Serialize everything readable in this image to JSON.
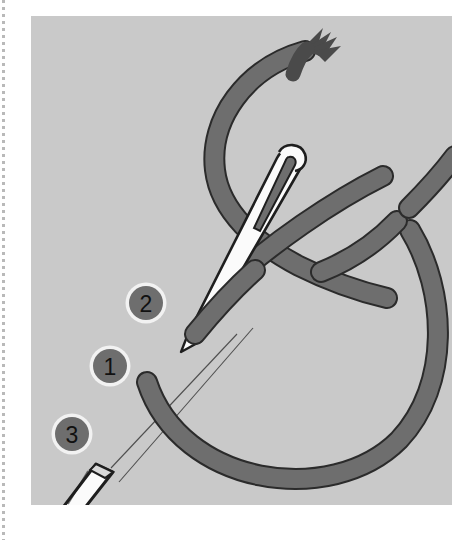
{
  "figure": {
    "background_color": "#c9c9c9",
    "page_color": "#ffffff",
    "thread_color": "#6e6e6e",
    "thread_outline_color": "#2b2b2b",
    "needle_color": "#fbfbfb",
    "needle_outline_color": "#1e1e1e",
    "marker_fill_color": "#6e6e6e",
    "marker_ring_color": "#f2f2f2",
    "marker_text_color": "#111111",
    "guide_line_color": "#3a3a3a"
  },
  "markers": [
    {
      "label": "2",
      "name": "step-marker-2",
      "cx": 115,
      "cy": 287,
      "r": 18
    },
    {
      "label": "1",
      "name": "step-marker-1",
      "cx": 79,
      "cy": 350,
      "r": 18
    },
    {
      "label": "3",
      "name": "step-marker-3",
      "cx": 41,
      "cy": 418,
      "r": 18
    }
  ],
  "elements": {
    "needle": "sewing-needle",
    "needle_eye": "needle-eye",
    "thread_loop": "thread-loop",
    "thread_tail_frayed": "frayed-thread-end",
    "thread_segments_right": "segmented-thread-right",
    "fabric_guide_lines": "fabric-guide-lines",
    "white_tube": "white-thread-end"
  },
  "margin": {
    "left_strip": "perforated-margin"
  }
}
